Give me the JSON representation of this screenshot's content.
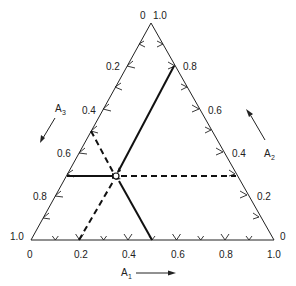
{
  "diagram": {
    "type": "ternary",
    "vertices": {
      "top": {
        "label_left": "0",
        "label_right": "1.0"
      },
      "bottom_left": {
        "label_left": "1.0",
        "label_below": "0"
      },
      "bottom_right": {
        "label_right": "0",
        "label_below": "1.0"
      }
    },
    "axes": {
      "A1": {
        "label": "A",
        "sub": "1",
        "edge": "bottom",
        "ticks": [
          "0.2",
          "0.4",
          "0.6",
          "0.8"
        ],
        "direction": "left-to-right"
      },
      "A2": {
        "label": "A",
        "sub": "2",
        "edge": "right",
        "ticks": [
          "0.8",
          "0.6",
          "0.4",
          "0.2"
        ],
        "direction": "bottom-to-top"
      },
      "A3": {
        "label": "A",
        "sub": "3",
        "edge": "left",
        "ticks": [
          "0.2",
          "0.4",
          "0.6",
          "0.8"
        ],
        "direction": "top-to-bottom"
      }
    },
    "point": {
      "A1": 0.35,
      "A2": 0.35,
      "A3": 0.3
    },
    "lines": [
      {
        "style": "solid",
        "from_edge": "right",
        "value": "0.8",
        "desc": "A2 readout line"
      },
      {
        "style": "solid",
        "from_edge": "left",
        "value": "0.7",
        "desc": "arrow into point from left edge"
      },
      {
        "style": "solid",
        "from_edge": "bottom",
        "value": "0.5",
        "desc": "arrow into point from bottom edge"
      },
      {
        "style": "dashed",
        "from_edge": "left",
        "value": "0.55"
      },
      {
        "style": "dashed",
        "from_edge": "bottom",
        "value": "0.2"
      },
      {
        "style": "dashed",
        "from_edge": "right",
        "value": "0.3"
      }
    ]
  }
}
